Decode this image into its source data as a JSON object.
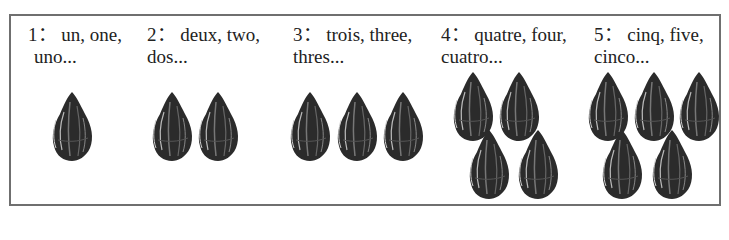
{
  "groups": [
    {
      "count": 1,
      "line1": "1： un, one,",
      "line2": "uno..."
    },
    {
      "count": 2,
      "line1": "2： deux, two,",
      "line2": "dos..."
    },
    {
      "count": 3,
      "line1": "3： trois, three,",
      "line2": "thres..."
    },
    {
      "count": 4,
      "line1": "4： quatre, four,",
      "line2": "cuatro..."
    },
    {
      "count": 5,
      "line1": "5： cinq, five,",
      "line2": "cinco..."
    }
  ],
  "seed_icon": "seed-icon",
  "colors": {
    "border": "#6f6f6f",
    "seed": "#2a2a2a",
    "text": "#222222"
  }
}
